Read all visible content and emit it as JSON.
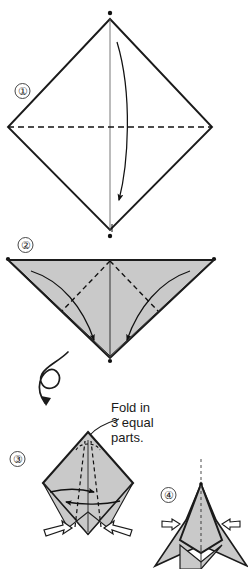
{
  "page": {
    "background_color": "#ffffff",
    "width": 248,
    "height": 569
  },
  "style": {
    "paper_fill": "#c9c9c9",
    "paper_fill_light": "#d4d4d4",
    "paper_fill_dark": "#bdbdbd",
    "line_color": "#1b1b1b",
    "text_color": "#1a1a1a",
    "arrow_color": "#111111",
    "hollow_arrow_fill": "#ffffff"
  },
  "steps": [
    {
      "id": "step-1",
      "number_label": "①",
      "number_text": "1",
      "shape": "square-diamond",
      "fill": "none",
      "lines": [
        {
          "kind": "solid",
          "name": "vertical-center-crease"
        },
        {
          "kind": "dashed",
          "name": "horizontal-valley-fold"
        }
      ],
      "arrows": [
        {
          "kind": "curved-solid",
          "name": "fold-down-arrow",
          "direction": "down"
        }
      ],
      "vertex_dots": 2
    },
    {
      "id": "step-2",
      "number_label": "②",
      "number_text": "2",
      "shape": "triangle-point-down",
      "fill": "#c9c9c9",
      "lines": [
        {
          "kind": "solid",
          "name": "vertical-center-crease"
        },
        {
          "kind": "dashed",
          "name": "left-diagonal-fold"
        },
        {
          "kind": "dashed",
          "name": "right-diagonal-fold"
        }
      ],
      "arrows": [
        {
          "kind": "curved-solid",
          "name": "left-flap-fold-arrow",
          "direction": "down-right"
        },
        {
          "kind": "curved-solid",
          "name": "right-flap-fold-arrow",
          "direction": "down-left"
        }
      ],
      "vertex_dots": 3
    },
    {
      "id": "step-3",
      "number_label": "③",
      "number_text": "3",
      "shape": "kite-diamond",
      "fill": "#c9c9c9",
      "caption": {
        "lines": [
          "Fold in",
          "3 equal",
          "parts."
        ],
        "full_text": "Fold in 3 equal parts.",
        "leader": "curved-leader-line"
      },
      "lines": [
        {
          "kind": "solid",
          "name": "vertical-center-crease"
        },
        {
          "kind": "dashed",
          "name": "left-third-fold"
        },
        {
          "kind": "dashed",
          "name": "right-third-fold"
        },
        {
          "kind": "dashed",
          "name": "apex-arc"
        }
      ],
      "arrows": [
        {
          "kind": "straight-solid",
          "name": "fold-right-arrow",
          "direction": "right"
        },
        {
          "kind": "straight-solid",
          "name": "fold-left-arrow",
          "direction": "left"
        },
        {
          "kind": "hollow",
          "name": "pull-out-left-arrow",
          "direction": "down-left"
        },
        {
          "kind": "hollow",
          "name": "pull-out-right-arrow",
          "direction": "down-right"
        }
      ]
    },
    {
      "id": "step-4",
      "number_label": "④",
      "number_text": "4",
      "shape": "arrow-head-form",
      "fill": "#c9c9c9",
      "lines": [
        {
          "kind": "dotted",
          "name": "vertical-center-axis"
        },
        {
          "kind": "solid",
          "name": "left-flap-edge"
        },
        {
          "kind": "solid",
          "name": "right-flap-edge"
        }
      ],
      "arrows": [
        {
          "kind": "hollow",
          "name": "open-left-arrow",
          "direction": "left"
        },
        {
          "kind": "hollow",
          "name": "open-right-arrow",
          "direction": "right"
        }
      ]
    }
  ],
  "symbols": [
    {
      "id": "turn-over-symbol",
      "name": "turn-over-loop-arrow",
      "meaning": "turn the model over",
      "between_steps": [
        2,
        3
      ]
    }
  ]
}
